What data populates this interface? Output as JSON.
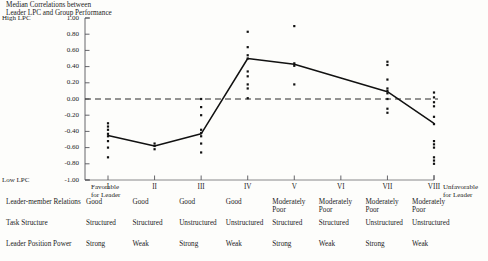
{
  "title": {
    "line1": "Median Correlations between",
    "line2": "Leader LPC and Group Performance"
  },
  "axes": {
    "y_high_label": "High LPC",
    "y_low_label": "Low LPC",
    "y_ticks": [
      "1.00",
      "0.80",
      "0.60",
      "0.40",
      "0.20",
      "0.00",
      "-0.20",
      "-0.40",
      "-0.60",
      "-0.80",
      "-1.00"
    ],
    "y_min": -1.0,
    "y_max": 1.0,
    "x_ticks": [
      "I",
      "II",
      "III",
      "IV",
      "V",
      "VI",
      "VII",
      "VIII"
    ],
    "x_left_cap_line1": "Favorable",
    "x_left_cap_line2": "for Leader",
    "x_right_cap_line1": "Unfavorable",
    "x_right_cap_line2": "for Leader",
    "zero_reference": "0.00"
  },
  "rows": [
    {
      "label": "Leader-member Relations",
      "values": [
        [
          "Good"
        ],
        [
          "Good"
        ],
        [
          "Good"
        ],
        [
          "Good"
        ],
        [
          "Moderately",
          "Poor"
        ],
        [
          "Moderately",
          "Poor"
        ],
        [
          "Moderately",
          "Poor"
        ],
        [
          "Moderately",
          "Poor"
        ]
      ]
    },
    {
      "label": "Task Structure",
      "values": [
        [
          "Structured"
        ],
        [
          "Structured"
        ],
        [
          "Unstructured"
        ],
        [
          "Unstructured"
        ],
        [
          "Structured"
        ],
        [
          "Structured"
        ],
        [
          "Unstructured"
        ],
        [
          "Unstructured"
        ]
      ]
    },
    {
      "label": "Leader Position Power",
      "values": [
        [
          "Strong"
        ],
        [
          "Weak"
        ],
        [
          "Strong"
        ],
        [
          "Weak"
        ],
        [
          "Strong"
        ],
        [
          "Weak"
        ],
        [
          "Strong"
        ],
        [
          "Weak"
        ]
      ]
    }
  ],
  "chart_data": {
    "type": "scatter",
    "title": "Median Correlations between Leader LPC and Group Performance",
    "xlabel": "Octant",
    "ylabel": "Correlation between Leader LPC and Group Performance",
    "ylim": [
      -1.0,
      1.0
    ],
    "xlim": [
      "I",
      "VIII"
    ],
    "grid": false,
    "legend": "none",
    "categories": [
      "I",
      "II",
      "III",
      "IV",
      "V",
      "VI",
      "VII",
      "VIII"
    ],
    "zero_line": 0.0,
    "median_line": {
      "name": "Median correlation",
      "style": "solid",
      "values": [
        -0.45,
        -0.58,
        -0.43,
        0.5,
        0.43,
        0.26,
        0.09,
        -0.3
      ]
    },
    "scatter_points": [
      {
        "octant": "I",
        "values": [
          -0.3,
          -0.34,
          -0.38,
          -0.43,
          -0.46,
          -0.52,
          -0.6,
          -0.72
        ]
      },
      {
        "octant": "II",
        "values": [
          -0.55,
          -0.58,
          -0.62
        ]
      },
      {
        "octant": "III",
        "values": [
          0.0,
          -0.1,
          -0.2,
          -0.38,
          -0.42,
          -0.46,
          -0.55,
          -0.66
        ]
      },
      {
        "octant": "IV",
        "values": [
          0.83,
          0.64,
          0.54,
          0.5,
          0.34,
          0.28,
          0.18,
          0.13,
          0.01
        ]
      },
      {
        "octant": "V",
        "values": [
          0.9,
          0.44,
          0.41,
          0.18
        ]
      },
      {
        "octant": "VI",
        "values": []
      },
      {
        "octant": "VII",
        "values": [
          0.46,
          0.42,
          0.24,
          0.13,
          0.1,
          0.07,
          0.0,
          -0.12,
          -0.17
        ]
      },
      {
        "octant": "VIII",
        "values": [
          0.08,
          0.02,
          -0.04,
          -0.09,
          -0.22,
          -0.31,
          -0.52,
          -0.56,
          -0.6,
          -0.72,
          -0.76,
          -0.8
        ]
      }
    ]
  }
}
